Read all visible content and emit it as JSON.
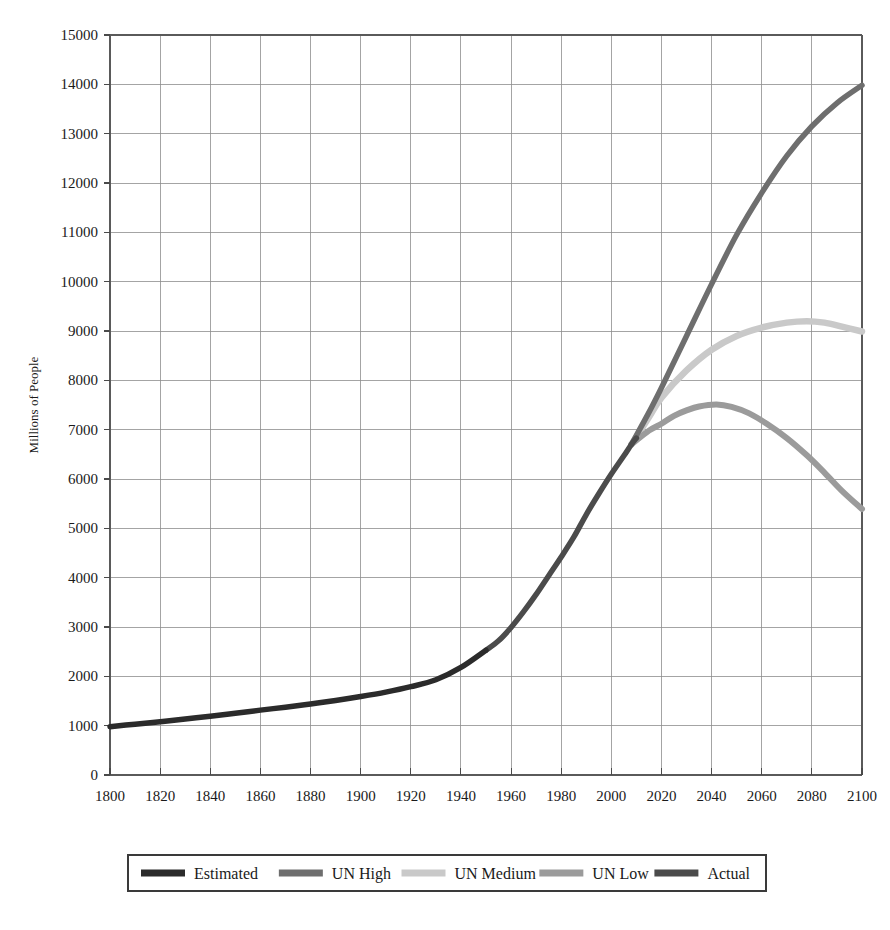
{
  "chart_data": {
    "type": "line",
    "title": "",
    "xlabel": "",
    "ylabel": "Millions of People",
    "xlim": [
      1800,
      2100
    ],
    "ylim": [
      0,
      15000
    ],
    "x_ticks": [
      1800,
      1820,
      1840,
      1860,
      1880,
      1900,
      1920,
      1940,
      1960,
      1980,
      2000,
      2020,
      2040,
      2060,
      2080,
      2100
    ],
    "y_ticks": [
      0,
      1000,
      2000,
      3000,
      4000,
      5000,
      6000,
      7000,
      8000,
      9000,
      10000,
      11000,
      12000,
      13000,
      14000,
      15000
    ],
    "grid": true,
    "legend_position": "bottom",
    "series": [
      {
        "name": "Estimated",
        "color": "#2b2b2b",
        "width": 5.5,
        "points": [
          [
            1800,
            980
          ],
          [
            1810,
            1030
          ],
          [
            1820,
            1080
          ],
          [
            1830,
            1135
          ],
          [
            1840,
            1190
          ],
          [
            1850,
            1250
          ],
          [
            1860,
            1315
          ],
          [
            1870,
            1375
          ],
          [
            1880,
            1440
          ],
          [
            1890,
            1510
          ],
          [
            1900,
            1590
          ],
          [
            1910,
            1680
          ],
          [
            1920,
            1790
          ],
          [
            1930,
            1930
          ],
          [
            1940,
            2180
          ],
          [
            1950,
            2530
          ]
        ]
      },
      {
        "name": "Actual",
        "color": "#4b4b4b",
        "width": 5.5,
        "points": [
          [
            1950,
            2530
          ],
          [
            1955,
            2720
          ],
          [
            1960,
            2990
          ],
          [
            1965,
            3310
          ],
          [
            1970,
            3660
          ],
          [
            1975,
            4040
          ],
          [
            1980,
            4420
          ],
          [
            1985,
            4820
          ],
          [
            1990,
            5280
          ],
          [
            1995,
            5700
          ],
          [
            2000,
            6100
          ],
          [
            2005,
            6470
          ],
          [
            2008,
            6700
          ],
          [
            2010,
            6830
          ]
        ]
      },
      {
        "name": "UN High",
        "color": "#6e6e6e",
        "width": 5.5,
        "points": [
          [
            2008,
            6700
          ],
          [
            2015,
            7350
          ],
          [
            2020,
            7850
          ],
          [
            2030,
            8900
          ],
          [
            2040,
            9950
          ],
          [
            2050,
            10950
          ],
          [
            2060,
            11800
          ],
          [
            2070,
            12550
          ],
          [
            2080,
            13150
          ],
          [
            2090,
            13620
          ],
          [
            2100,
            13980
          ]
        ]
      },
      {
        "name": "UN Medium",
        "color": "#c9c9c9",
        "width": 6.5,
        "points": [
          [
            2008,
            6700
          ],
          [
            2015,
            7250
          ],
          [
            2020,
            7650
          ],
          [
            2030,
            8200
          ],
          [
            2040,
            8620
          ],
          [
            2050,
            8900
          ],
          [
            2060,
            9070
          ],
          [
            2070,
            9170
          ],
          [
            2078,
            9200
          ],
          [
            2085,
            9170
          ],
          [
            2092,
            9090
          ],
          [
            2100,
            8990
          ]
        ]
      },
      {
        "name": "UN Low",
        "color": "#9b9b9b",
        "width": 6.0,
        "points": [
          [
            2008,
            6700
          ],
          [
            2015,
            6980
          ],
          [
            2020,
            7120
          ],
          [
            2025,
            7280
          ],
          [
            2030,
            7390
          ],
          [
            2035,
            7470
          ],
          [
            2042,
            7510
          ],
          [
            2048,
            7460
          ],
          [
            2055,
            7330
          ],
          [
            2062,
            7120
          ],
          [
            2070,
            6830
          ],
          [
            2078,
            6480
          ],
          [
            2085,
            6130
          ],
          [
            2092,
            5760
          ],
          [
            2100,
            5390
          ]
        ]
      }
    ],
    "legend_entries": [
      {
        "label": "Estimated",
        "color": "#2b2b2b"
      },
      {
        "label": "UN High",
        "color": "#6e6e6e"
      },
      {
        "label": "UN Medium",
        "color": "#c9c9c9"
      },
      {
        "label": "UN Low",
        "color": "#9b9b9b"
      },
      {
        "label": "Actual",
        "color": "#4b4b4b"
      }
    ]
  },
  "axes": {
    "y_title": "Millions of People"
  }
}
